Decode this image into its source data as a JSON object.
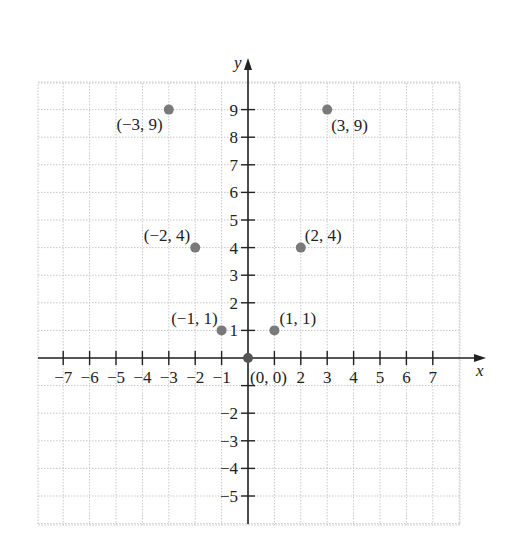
{
  "chart_data": {
    "type": "scatter",
    "title": "",
    "xlabel": "x",
    "ylabel": "y",
    "xlim": [
      -8,
      8
    ],
    "ylim": [
      -6,
      10
    ],
    "grid": true,
    "x_ticks": [
      -7,
      -6,
      -5,
      -4,
      -3,
      -2,
      -1,
      1,
      2,
      3,
      4,
      5,
      6,
      7
    ],
    "x_tick_labels": [
      "-7",
      "-6",
      "-5",
      "-4",
      "-3",
      "-2",
      "-1",
      "",
      "2",
      "3",
      "4",
      "5",
      "6",
      "7"
    ],
    "y_ticks": [
      -5,
      -4,
      -3,
      -2,
      -1,
      1,
      2,
      3,
      4,
      5,
      6,
      7,
      8,
      9
    ],
    "y_tick_labels": [
      "-5",
      "-4",
      "-3",
      "-2",
      "",
      "1",
      "2",
      "3",
      "4",
      "5",
      "6",
      "7",
      "8",
      "9"
    ],
    "points": [
      {
        "x": -3,
        "y": 9,
        "label": "(−3, 9)"
      },
      {
        "x": -2,
        "y": 4,
        "label": "(−2, 4)"
      },
      {
        "x": -1,
        "y": 1,
        "label": "(−1, 1)"
      },
      {
        "x": 0,
        "y": 0,
        "label": "(0, 0)"
      },
      {
        "x": 1,
        "y": 1,
        "label": "(1, 1)"
      },
      {
        "x": 2,
        "y": 4,
        "label": "(2, 4)"
      },
      {
        "x": 3,
        "y": 9,
        "label": "(3, 9)"
      }
    ],
    "point_color": "#7a7a7a",
    "axis_color": "#222222",
    "grid_color": "#c8c8c8"
  }
}
